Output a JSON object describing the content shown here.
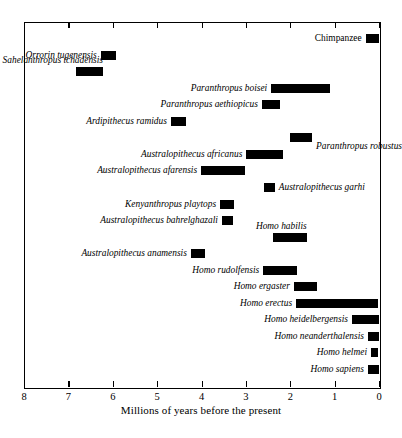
{
  "chart_data": {
    "type": "bar",
    "orientation": "horizontal-range",
    "title": "",
    "xlabel": "Millions of years before the present",
    "ylabel": "",
    "xlim": [
      8,
      0
    ],
    "x_axis_reversed": true,
    "grid": false,
    "legend": false,
    "tick_labels": [
      "8",
      "7",
      "6",
      "5",
      "4",
      "3",
      "2",
      "1",
      "0"
    ],
    "tick_values": [
      8,
      7,
      6,
      5,
      4,
      3,
      2,
      1,
      0
    ],
    "bar_color": "#000000",
    "frame_color": "#000000",
    "background": "#ffffff",
    "units": "millions of years before the present",
    "categories": [
      "Chimpanzee",
      "Orrorin tugenensis",
      "Sahelanthropus tchadensis",
      "Paranthropus boisei",
      "Paranthropus aethiopicus",
      "Ardipithecus ramidus",
      "Paranthropus robustus",
      "Australopithecus africanus",
      "Australopithecus afarensis",
      "Australopithecus garhi",
      "Kenyanthropus playtops",
      "Australopithecus bahrelghazali",
      "Homo habilis",
      "Australopithecus anamensis",
      "Homo rudolfensis",
      "Homo ergaster",
      "Homo erectus",
      "Homo heidelbergensis",
      "Homo neanderthalensis",
      "Homo helmei",
      "Homo sapiens"
    ],
    "ranges": [
      {
        "name": "Chimpanzee",
        "start": 0.3,
        "end": 0.0,
        "label_side": "left",
        "italic": false
      },
      {
        "name": "Orrorin tugenensis",
        "start": 6.27,
        "end": 5.93,
        "label_side": "left",
        "italic": true
      },
      {
        "name": "Sahelanthropus tchadensis",
        "start": 6.83,
        "end": 6.22,
        "label_side": "above-left",
        "italic": true
      },
      {
        "name": "Paranthropus boisei",
        "start": 2.43,
        "end": 1.1,
        "label_side": "left",
        "italic": true
      },
      {
        "name": "Paranthropus aethiopicus",
        "start": 2.64,
        "end": 2.23,
        "label_side": "left",
        "italic": true
      },
      {
        "name": "Ardipithecus ramidus",
        "start": 4.69,
        "end": 4.35,
        "label_side": "left",
        "italic": true
      },
      {
        "name": "Paranthropus robustus",
        "start": 2.01,
        "end": 1.51,
        "label_side": "below-right",
        "italic": true
      },
      {
        "name": "Australopithecus africanus",
        "start": 2.99,
        "end": 2.16,
        "label_side": "left",
        "italic": true
      },
      {
        "name": "Australopithecus afarensis",
        "start": 4.01,
        "end": 3.02,
        "label_side": "left",
        "italic": true
      },
      {
        "name": "Australopithecus garhi",
        "start": 2.6,
        "end": 2.35,
        "label_side": "right",
        "italic": true
      },
      {
        "name": "Kenyanthropus playtops",
        "start": 3.58,
        "end": 3.27,
        "label_side": "left",
        "italic": true
      },
      {
        "name": "Australopithecus bahrelghazali",
        "start": 3.54,
        "end": 3.29,
        "label_side": "left",
        "italic": true
      },
      {
        "name": "Homo habilis",
        "start": 2.38,
        "end": 1.63,
        "label_side": "above-left",
        "italic": true
      },
      {
        "name": "Australopithecus anamensis",
        "start": 4.24,
        "end": 3.92,
        "label_side": "left",
        "italic": true
      },
      {
        "name": "Homo rudolfensis",
        "start": 2.61,
        "end": 1.85,
        "label_side": "left",
        "italic": true
      },
      {
        "name": "Homo ergaster",
        "start": 1.92,
        "end": 1.4,
        "label_side": "left",
        "italic": true
      },
      {
        "name": "Homo erectus",
        "start": 1.87,
        "end": 0.02,
        "label_side": "left",
        "italic": true
      },
      {
        "name": "Homo heidelbergensis",
        "start": 0.61,
        "end": 0.0,
        "label_side": "left",
        "italic": true
      },
      {
        "name": "Homo neanderthalensis",
        "start": 0.25,
        "end": 0.0,
        "label_side": "left",
        "italic": true
      },
      {
        "name": "Homo helmei",
        "start": 0.18,
        "end": 0.02,
        "label_side": "left",
        "italic": true
      },
      {
        "name": "Homo sapiens",
        "start": 0.25,
        "end": 0.0,
        "label_side": "left",
        "italic": true
      }
    ]
  },
  "axis": {
    "title": "Millions of years before the present",
    "ticks": [
      "8",
      "7",
      "6",
      "5",
      "4",
      "3",
      "2",
      "1",
      "0"
    ]
  },
  "taxa": [
    {
      "label": "Chimpanzee"
    },
    {
      "label": "Orrorin tugenensis"
    },
    {
      "label": "Sahelanthropus tchadensis"
    },
    {
      "label": "Paranthropus boisei"
    },
    {
      "label": "Paranthropus aethiopicus"
    },
    {
      "label": "Ardipithecus ramidus"
    },
    {
      "label": "Paranthropus robustus"
    },
    {
      "label": "Australopithecus africanus"
    },
    {
      "label": "Australopithecus afarensis"
    },
    {
      "label": "Australopithecus garhi"
    },
    {
      "label": "Kenyanthropus playtops"
    },
    {
      "label": "Australopithecus bahrelghazali"
    },
    {
      "label": "Homo habilis"
    },
    {
      "label": "Australopithecus anamensis"
    },
    {
      "label": "Homo rudolfensis"
    },
    {
      "label": "Homo ergaster"
    },
    {
      "label": "Homo erectus"
    },
    {
      "label": "Homo heidelbergensis"
    },
    {
      "label": "Homo neanderthalensis"
    },
    {
      "label": "Homo helmei"
    },
    {
      "label": "Homo sapiens"
    }
  ]
}
